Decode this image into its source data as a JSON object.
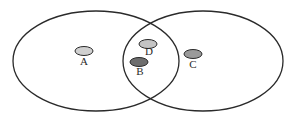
{
  "diagram": {
    "type": "venn",
    "sets": [
      {
        "name": "left-set"
      },
      {
        "name": "right-set"
      }
    ],
    "items": [
      {
        "id": "A",
        "label": "A",
        "region": "left-only",
        "fill": "#d0d0d0"
      },
      {
        "id": "D",
        "label": "D",
        "region": "intersection",
        "fill": "#c4c4c4"
      },
      {
        "id": "B",
        "label": "B",
        "region": "intersection",
        "fill": "#6e6e6e"
      },
      {
        "id": "C",
        "label": "C",
        "region": "right-only",
        "fill": "#9a9a9a"
      }
    ]
  }
}
